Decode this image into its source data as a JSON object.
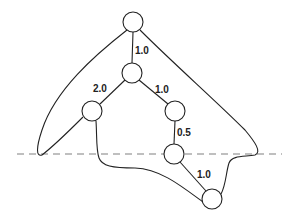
{
  "diagram": {
    "type": "weighted tree with enclosing contour and horizontal cut line",
    "nodes": [
      {
        "id": "n0",
        "x": 133,
        "y": 22
      },
      {
        "id": "n1",
        "x": 132,
        "y": 73
      },
      {
        "id": "n2",
        "x": 92,
        "y": 111
      },
      {
        "id": "n3",
        "x": 175,
        "y": 111
      },
      {
        "id": "n4",
        "x": 174,
        "y": 154
      },
      {
        "id": "n5",
        "x": 212,
        "y": 199
      }
    ],
    "edges": [
      {
        "from": "n0",
        "to": "n1",
        "weight": "1.0"
      },
      {
        "from": "n1",
        "to": "n2",
        "weight": "2.0"
      },
      {
        "from": "n1",
        "to": "n3",
        "weight": "1.0"
      },
      {
        "from": "n3",
        "to": "n4",
        "weight": "0.5"
      },
      {
        "from": "n4",
        "to": "n5",
        "weight": "1.0"
      }
    ],
    "labels": {
      "e0": "1.0",
      "e1": "2.0",
      "e2": "1.0",
      "e3": "0.5",
      "e4": "1.0"
    },
    "cut_line": {
      "y": 154,
      "style": "dashed",
      "color": "#aaaaaa"
    }
  }
}
